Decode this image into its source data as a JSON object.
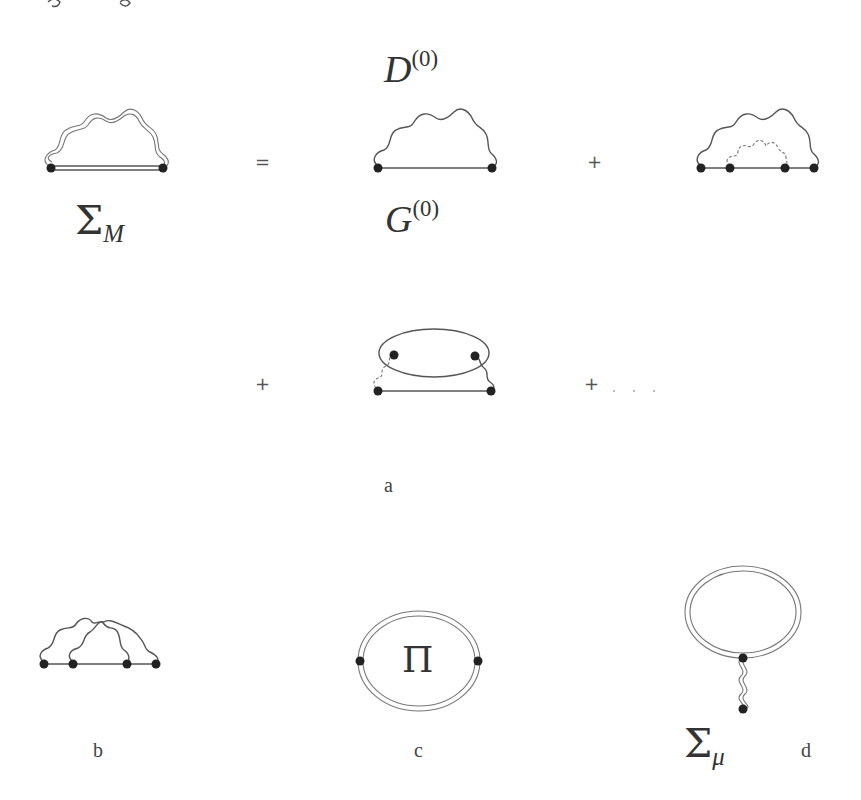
{
  "header": {
    "clipped_text": "a) -g"
  },
  "row1": {
    "lhs_label": {
      "symbol": "Σ",
      "subscript": "M"
    },
    "equals": "=",
    "term1_top_label": {
      "symbol": "D",
      "superscript": "(0)"
    },
    "term1_bottom_label": {
      "symbol": "G",
      "superscript": "(0)"
    },
    "plus": "+"
  },
  "row2": {
    "plus_left": "+",
    "plus_right": "+",
    "ellipsis": ". . ."
  },
  "captions": {
    "a": "a",
    "b": "b",
    "c": "c",
    "d": "d"
  },
  "diagram_c": {
    "center_label": "Π"
  },
  "diagram_d": {
    "label": {
      "symbol": "Σ",
      "subscript": "μ"
    }
  },
  "colors": {
    "line": "#555555",
    "vertex": "#222222",
    "background": "#ffffff"
  }
}
